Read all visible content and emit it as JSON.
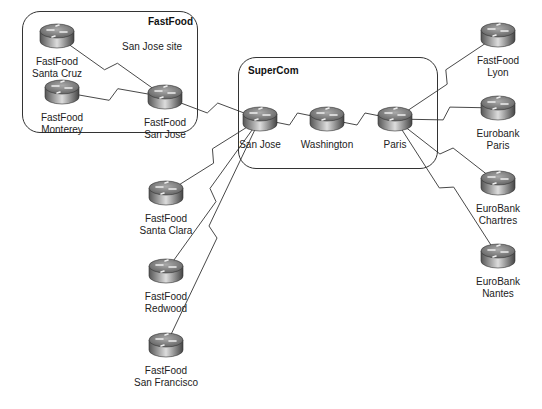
{
  "groups": [
    {
      "id": "fastfood",
      "title": "FastFood",
      "subtitle": "San Jose site",
      "x": 22,
      "y": 11,
      "w": 174,
      "h": 120
    },
    {
      "id": "supercom",
      "title": "SuperCom",
      "subtitle": "",
      "x": 238,
      "y": 57,
      "w": 198,
      "h": 110
    }
  ],
  "routers": [
    {
      "id": "ff-santacruz",
      "cx": 57,
      "cy": 36,
      "lines": [
        "FastFood",
        "Santa Cruz"
      ]
    },
    {
      "id": "ff-monterey",
      "cx": 62,
      "cy": 92,
      "lines": [
        "FastFood",
        "Monterey"
      ]
    },
    {
      "id": "ff-sanjose",
      "cx": 165,
      "cy": 97,
      "lines": [
        "FastFood",
        "San Jose"
      ]
    },
    {
      "id": "sc-sanjose",
      "cx": 260,
      "cy": 119,
      "lines": [
        "San Jose"
      ]
    },
    {
      "id": "sc-washington",
      "cx": 327,
      "cy": 119,
      "lines": [
        "Washington"
      ]
    },
    {
      "id": "sc-paris",
      "cx": 395,
      "cy": 119,
      "lines": [
        "Paris"
      ]
    },
    {
      "id": "ff-lyon",
      "cx": 498,
      "cy": 35,
      "lines": [
        "FastFood",
        "Lyon"
      ]
    },
    {
      "id": "eb-paris",
      "cx": 498,
      "cy": 108,
      "lines": [
        "Eurobank",
        "Paris"
      ]
    },
    {
      "id": "eb-chartres",
      "cx": 498,
      "cy": 183,
      "lines": [
        "EuroBank",
        "Chartres"
      ]
    },
    {
      "id": "eb-nantes",
      "cx": 498,
      "cy": 256,
      "lines": [
        "EuroBank",
        "Nantes"
      ]
    },
    {
      "id": "ff-santaclara",
      "cx": 166,
      "cy": 193,
      "lines": [
        "FastFood",
        "Santa Clara"
      ]
    },
    {
      "id": "ff-redwood",
      "cx": 166,
      "cy": 271,
      "lines": [
        "FastFood",
        "Redwood"
      ]
    },
    {
      "id": "ff-sanfrancisco",
      "cx": 166,
      "cy": 345,
      "lines": [
        "FastFood",
        "San Francisco"
      ]
    }
  ],
  "links": [
    [
      "ff-santacruz",
      "ff-sanjose"
    ],
    [
      "ff-monterey",
      "ff-sanjose"
    ],
    [
      "ff-sanjose",
      "sc-sanjose"
    ],
    [
      "sc-sanjose",
      "sc-washington"
    ],
    [
      "sc-washington",
      "sc-paris"
    ],
    [
      "sc-paris",
      "ff-lyon"
    ],
    [
      "sc-paris",
      "eb-paris"
    ],
    [
      "sc-paris",
      "eb-chartres"
    ],
    [
      "sc-paris",
      "eb-nantes"
    ],
    [
      "sc-sanjose",
      "ff-santaclara"
    ],
    [
      "sc-sanjose",
      "ff-redwood"
    ],
    [
      "sc-sanjose",
      "ff-sanfrancisco"
    ]
  ]
}
